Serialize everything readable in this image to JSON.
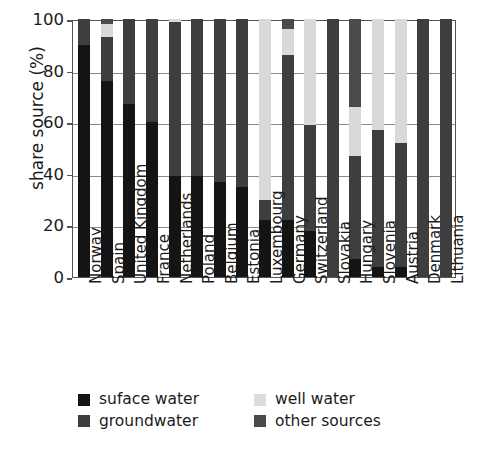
{
  "chart_data": {
    "type": "bar",
    "stacked": true,
    "title": "",
    "xlabel": "",
    "ylabel": "share source (%)",
    "ylim": [
      0,
      100
    ],
    "yticks": [
      0,
      20,
      40,
      60,
      80,
      100
    ],
    "grid": true,
    "legend_position": "bottom",
    "categories": [
      "Norway",
      "Spain",
      "United Kingdom",
      "France",
      "Netherlands",
      "Poland",
      "Belgium",
      "Estonia",
      "Luxembourg",
      "Germany",
      "Switzerland",
      "Slovakia",
      "Hungary",
      "Slovenia",
      "Austria",
      "Denmark",
      "Lithuania"
    ],
    "series": [
      {
        "name": "suface water",
        "key": "surface",
        "color": "#141414",
        "values": [
          90,
          76,
          67,
          60,
          39,
          39,
          37,
          35,
          22,
          22,
          18,
          0,
          7,
          4,
          4,
          0,
          0
        ]
      },
      {
        "name": "groundwater",
        "key": "ground",
        "color": "#3e3e3e",
        "values": [
          10,
          17,
          33,
          40,
          60,
          61,
          63,
          65,
          8,
          64,
          41,
          100,
          40,
          53,
          48,
          100,
          100
        ]
      },
      {
        "name": "well water",
        "key": "well",
        "color": "#d9d9d9",
        "values": [
          0,
          5,
          0,
          0,
          1,
          0,
          0,
          0,
          70,
          10,
          41,
          0,
          19,
          43,
          48,
          0,
          0
        ]
      },
      {
        "name": "other sources",
        "key": "other",
        "color": "#4a4a4a",
        "values": [
          0,
          2,
          0,
          0,
          0,
          0,
          0,
          0,
          0,
          4,
          0,
          0,
          34,
          0,
          0,
          0,
          0
        ]
      }
    ]
  },
  "legend": {
    "items": [
      {
        "label": "suface water",
        "key": "surface"
      },
      {
        "label": "well water",
        "key": "well"
      },
      {
        "label": "groundwater",
        "key": "ground"
      },
      {
        "label": "other sources",
        "key": "other"
      }
    ]
  }
}
